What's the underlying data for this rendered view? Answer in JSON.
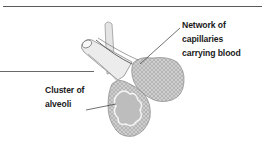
{
  "diagram": {
    "labels": [
      {
        "id": "capillaries",
        "lines": [
          "Network of",
          "capillaries",
          "carrying blood"
        ]
      },
      {
        "id": "alveoli",
        "lines": [
          "Cluster of",
          "alveoli"
        ]
      }
    ],
    "colors": {
      "text": "#1a1a1a",
      "rule": "#5a5a5a",
      "tissue_fill": "#c9c9c9",
      "tissue_dot": "#8a8a8a",
      "airway_fill": "#e6e6e6",
      "airway_stroke": "#8c8c8c",
      "alveolar_interior": "#bdbdbd"
    }
  }
}
